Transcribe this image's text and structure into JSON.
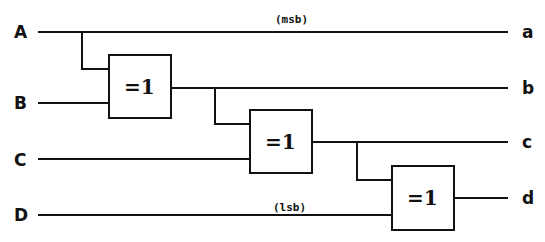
{
  "diagram": {
    "type": "logic-circuit",
    "inputs": [
      {
        "label": "A",
        "note": "(msb)"
      },
      {
        "label": "B",
        "note": ""
      },
      {
        "label": "C",
        "note": ""
      },
      {
        "label": "D",
        "note": "(lsb)"
      }
    ],
    "outputs": [
      {
        "label": "a"
      },
      {
        "label": "b"
      },
      {
        "label": "c"
      },
      {
        "label": "d"
      }
    ],
    "gates": [
      {
        "symbol": "=1",
        "inputs": [
          "A",
          "B"
        ],
        "output": "b"
      },
      {
        "symbol": "=1",
        "inputs": [
          "b",
          "C"
        ],
        "output": "c"
      },
      {
        "symbol": "=1",
        "inputs": [
          "c",
          "D"
        ],
        "output": "d"
      }
    ],
    "notes": {
      "msb": "(msb)",
      "lsb": "(lsb)"
    }
  }
}
